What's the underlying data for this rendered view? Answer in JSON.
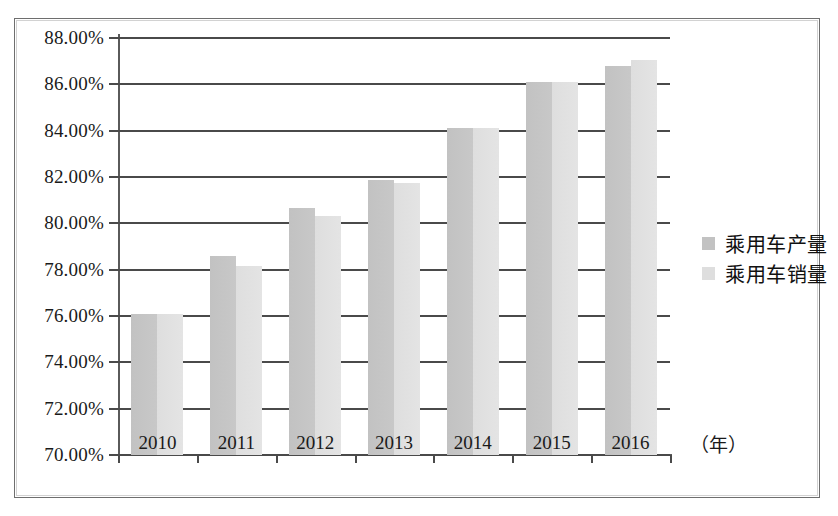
{
  "chart_data": {
    "type": "bar",
    "title": "",
    "subtitle": "",
    "xlabel": "（年）",
    "ylabel": "",
    "categories": [
      "2010",
      "2011",
      "2012",
      "2013",
      "2014",
      "2015",
      "2016"
    ],
    "series": [
      {
        "name": "乘用车产量",
        "color": "#c2c2c2",
        "values": [
          76.1,
          78.6,
          80.65,
          81.85,
          84.1,
          86.1,
          86.8
        ]
      },
      {
        "name": "乘用车销量",
        "color": "#dedede",
        "values": [
          76.1,
          78.15,
          80.3,
          81.75,
          84.1,
          86.1,
          87.05
        ]
      }
    ],
    "ylim": [
      70.0,
      88.0
    ],
    "ytick_values": [
      70.0,
      72.0,
      74.0,
      76.0,
      78.0,
      80.0,
      82.0,
      84.0,
      86.0,
      88.0
    ],
    "ytick_labels": [
      "70.00%",
      "72.00%",
      "74.00%",
      "76.00%",
      "78.00%",
      "80.00%",
      "82.00%",
      "84.00%",
      "86.00%",
      "88.00%"
    ],
    "grid": true,
    "grid_axis": "y",
    "legend_position": "right",
    "value_unit": "%"
  },
  "legend": {
    "items": [
      {
        "label": "乘用车产量",
        "swatch": "production-swatch"
      },
      {
        "label": "乘用车销量",
        "swatch": "sales-swatch"
      }
    ]
  },
  "axis": {
    "x_unit_label": "（年）"
  }
}
